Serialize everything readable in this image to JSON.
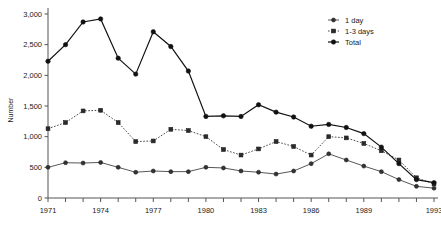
{
  "chart_data": {
    "type": "line",
    "title": "",
    "xlabel": "",
    "ylabel": "Number",
    "xlim": [
      1971,
      1993
    ],
    "ylim": [
      0,
      3000
    ],
    "ytick_labels": [
      "0",
      "500",
      "1,000",
      "1,500",
      "2,000",
      "2,500",
      "3,000"
    ],
    "ytick_values": [
      0,
      500,
      1000,
      1500,
      2000,
      2500,
      3000
    ],
    "xtick_labels": [
      "1971",
      "1974",
      "1977",
      "1980",
      "1983",
      "1986",
      "1989",
      "1993"
    ],
    "xtick_values": [
      1971,
      1974,
      1977,
      1980,
      1983,
      1986,
      1989,
      1993
    ],
    "x": [
      1971,
      1972,
      1973,
      1974,
      1975,
      1976,
      1977,
      1978,
      1979,
      1980,
      1981,
      1982,
      1983,
      1984,
      1985,
      1986,
      1987,
      1988,
      1989,
      1990,
      1991,
      1992,
      1993
    ],
    "grid": false,
    "legend_position": "top-right",
    "series": [
      {
        "name": "1 day",
        "marker": "circle",
        "linestyle": "solid",
        "color": "#333333",
        "values": [
          500,
          575,
          570,
          580,
          500,
          420,
          440,
          430,
          430,
          500,
          490,
          440,
          420,
          390,
          440,
          560,
          720,
          620,
          520,
          430,
          300,
          190,
          160
        ]
      },
      {
        "name": "1-3 days",
        "marker": "square",
        "linestyle": "dotted",
        "color": "#2b2b2b",
        "values": [
          1130,
          1230,
          1420,
          1430,
          1230,
          920,
          930,
          1120,
          1100,
          1000,
          790,
          700,
          800,
          920,
          840,
          700,
          1000,
          980,
          890,
          770,
          620,
          330,
          230
        ]
      },
      {
        "name": "Total",
        "marker": "filled-circle",
        "linestyle": "solid",
        "color": "#111111",
        "values": [
          2230,
          2500,
          2870,
          2920,
          2280,
          2020,
          2710,
          2470,
          2070,
          1330,
          1340,
          1330,
          1520,
          1400,
          1320,
          1170,
          1200,
          1150,
          1050,
          830,
          560,
          300,
          250
        ]
      }
    ]
  },
  "legend": {
    "items": [
      {
        "label": "1 day"
      },
      {
        "label": "1-3 days"
      },
      {
        "label": "Total"
      }
    ]
  }
}
